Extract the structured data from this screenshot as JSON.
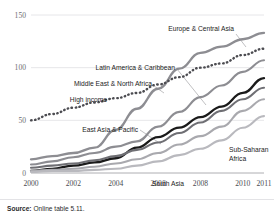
{
  "figure": {
    "clipped_top_text": "",
    "source_prefix": "Source:",
    "source_text": "Online table 5.11."
  },
  "chart_data": {
    "type": "line",
    "title": "",
    "subtitle": "",
    "xlabel": "",
    "ylabel": "",
    "x": [
      2000,
      2001,
      2002,
      2003,
      2004,
      2005,
      2006,
      2007,
      2008,
      2009,
      2010,
      2011
    ],
    "xtick_labels": [
      "2000",
      "2002",
      "2004",
      "2006",
      "2008",
      "2010",
      "2011"
    ],
    "xtick_values": [
      2000,
      2002,
      2004,
      2006,
      2008,
      2010,
      2011
    ],
    "ytick_labels": [
      "0",
      "50",
      "100",
      "150"
    ],
    "ytick_values": [
      0,
      50,
      100,
      150
    ],
    "ylim": [
      0,
      150
    ],
    "xlim": [
      2000,
      2011
    ],
    "grid": true,
    "legend_position": "inline-annotations",
    "series": [
      {
        "name": "Europe & Central Asia",
        "style": "solid",
        "color": "#8d8d92",
        "width": 2.3,
        "values": [
          13,
          16,
          19,
          24,
          41,
          61,
          80,
          99,
          114,
          120,
          127,
          133
        ]
      },
      {
        "name": "High income",
        "style": "dotted",
        "color": "#4c4c51",
        "width": 2.4,
        "values": [
          50,
          56,
          62,
          67,
          71,
          76,
          84,
          91,
          100,
          104,
          112,
          118
        ]
      },
      {
        "name": "Latin America & Caribbean",
        "style": "solid",
        "color": "#8d8d92",
        "width": 2.1,
        "values": [
          8,
          11,
          15,
          19,
          25,
          30,
          44,
          58,
          72,
          83,
          96,
          107
        ]
      },
      {
        "name": "East Asia & Pacific",
        "style": "solid",
        "color": "#1a1a1a",
        "width": 2.3,
        "values": [
          2,
          4,
          7,
          10,
          14,
          24,
          34,
          43,
          53,
          63,
          76,
          90
        ]
      },
      {
        "name": "Middle East & North Africa",
        "style": "solid",
        "color": "#6f6f74",
        "width": 2.1,
        "values": [
          5,
          7,
          9,
          12,
          16,
          22,
          29,
          38,
          48,
          59,
          70,
          81
        ]
      },
      {
        "name": "Sub-Saharan Africa",
        "style": "solid",
        "color": "#a9a9ae",
        "width": 2.1,
        "values": [
          2,
          3,
          4,
          6,
          9,
          13,
          19,
          27,
          35,
          44,
          59,
          70
        ]
      },
      {
        "name": "South Asia",
        "style": "solid",
        "color": "#b9b9be",
        "width": 2.1,
        "values": [
          1,
          2,
          2,
          3,
          4,
          7,
          11,
          17,
          23,
          31,
          43,
          54
        ]
      }
    ],
    "annotations": [
      {
        "label": "Europe & Central Asia",
        "anchor": "right-top"
      },
      {
        "label": "Latin America & Caribbean",
        "anchor": "mid-left"
      },
      {
        "label": "Middle East & North Africa",
        "anchor": "mid-left"
      },
      {
        "label": "High income",
        "anchor": "left"
      },
      {
        "label": "East Asia & Pacific",
        "anchor": "left"
      },
      {
        "label": "Sub-Saharan Africa",
        "anchor": "right-low"
      },
      {
        "label": "South Asia",
        "anchor": "bottom"
      }
    ]
  }
}
